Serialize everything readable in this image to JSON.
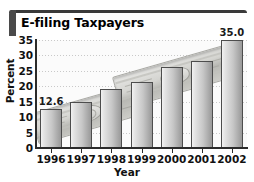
{
  "chart_data": {
    "type": "bar",
    "title": "E-filing Taxpayers",
    "xlabel": "Year",
    "ylabel": "Percent",
    "categories": [
      "1996",
      "1997",
      "1998",
      "1999",
      "2000",
      "2001",
      "2002"
    ],
    "values": [
      12.6,
      15.0,
      19.0,
      21.5,
      26.3,
      28.3,
      35.0
    ],
    "point_labels": [
      "12.6",
      "",
      "",
      "",
      "",
      "",
      "35.0"
    ],
    "ylim": [
      0,
      35
    ],
    "yticks": [
      0,
      5,
      10,
      15,
      20,
      25,
      30,
      35
    ],
    "ytick_labels": [
      "0",
      "5",
      "10",
      "15",
      "20",
      "25",
      "30",
      "35"
    ],
    "grid": "horizontal-dotted",
    "legend": "none",
    "annotations": [
      "stacks of banknotes illustrated behind the bars"
    ]
  },
  "style": {
    "bar_outline": "#4d4d4d",
    "bar_fill_light": "#f2f2f2",
    "bar_fill_dark": "#9a9a9a",
    "axis_color": "#2b2b2b",
    "grid_color": "#c9c9c9",
    "title_bar_color": "#4a4a4a",
    "plot_background": "#fbfbfb",
    "text_color": "#111111"
  }
}
